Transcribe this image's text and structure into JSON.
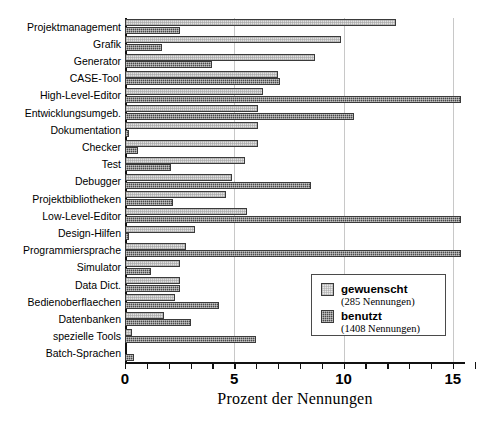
{
  "chart_data": {
    "type": "bar",
    "orientation": "horizontal",
    "title": "",
    "xlabel": "Prozent der Nennungen",
    "ylabel": "",
    "xlim": [
      0,
      15.7
    ],
    "xticks": [
      0,
      5,
      10,
      15
    ],
    "xtick_labels": [
      "0",
      "5",
      "10",
      "15"
    ],
    "minor_tick_step": 1,
    "grid": true,
    "grid_axis": "x",
    "legend_position": "center-right-inside",
    "categories": [
      "Projektmanagement",
      "Grafik",
      "Generator",
      "CASE-Tool",
      "High-Level-Editor",
      "Entwicklungsumgeb.",
      "Dokumentation",
      "Checker",
      "Test",
      "Debugger",
      "Projektbibliotheken",
      "Low-Level-Editor",
      "Design-Hilfen",
      "Programmiersprache",
      "Simulator",
      "Data Dict.",
      "Bedienoberflaechen",
      "Datenbanken",
      "spezielle Tools",
      "Batch-Sprachen"
    ],
    "series": [
      {
        "name": "gewuenscht",
        "count_label": "(285 Nennungen)",
        "fill": "light-hatch",
        "values": [
          12.4,
          9.9,
          8.7,
          7.0,
          6.3,
          6.1,
          6.1,
          6.1,
          5.5,
          4.9,
          4.6,
          5.6,
          3.2,
          2.8,
          2.5,
          2.5,
          2.3,
          1.8,
          0.3,
          0.0
        ]
      },
      {
        "name": "benutzt",
        "count_label": "(1408 Nennungen)",
        "fill": "dark-hatch",
        "values": [
          2.5,
          1.7,
          4.0,
          7.1,
          15.4,
          10.5,
          0.2,
          0.6,
          2.1,
          8.5,
          2.2,
          15.4,
          0.2,
          15.4,
          1.2,
          2.5,
          4.3,
          3.0,
          6.0,
          0.4
        ]
      }
    ]
  },
  "legend": {
    "entries": [
      {
        "name": "gewuenscht",
        "count": "(285 Nennungen)"
      },
      {
        "name": "benutzt",
        "count": "(1408 Nennungen)"
      }
    ]
  },
  "axis": {
    "x_title": "Prozent der Nennungen"
  }
}
